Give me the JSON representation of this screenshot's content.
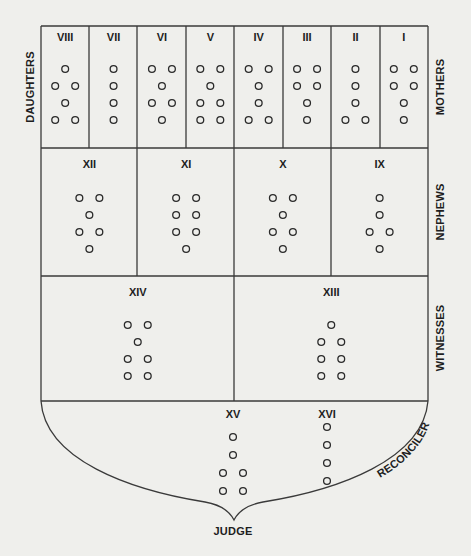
{
  "diagram": {
    "side_labels": {
      "daughters": "DAUGHTERS",
      "mothers": "MOTHERS",
      "nephews": "NEPHEWS",
      "witnesses": "WITNESSES",
      "reconciler": "RECONCILER",
      "judge": "JUDGE"
    },
    "rows": [
      {
        "name": "mothers-daughters",
        "figures": [
          {
            "numeral": "VIII",
            "lines": [
              1,
              2,
              1,
              2
            ]
          },
          {
            "numeral": "VII",
            "lines": [
              1,
              1,
              1,
              1
            ]
          },
          {
            "numeral": "VI",
            "lines": [
              2,
              1,
              2,
              1
            ]
          },
          {
            "numeral": "V",
            "lines": [
              2,
              1,
              2,
              2
            ]
          },
          {
            "numeral": "IV",
            "lines": [
              2,
              1,
              1,
              2
            ]
          },
          {
            "numeral": "III",
            "lines": [
              2,
              2,
              1,
              1
            ]
          },
          {
            "numeral": "II",
            "lines": [
              1,
              1,
              1,
              2
            ]
          },
          {
            "numeral": "I",
            "lines": [
              2,
              2,
              1,
              1
            ]
          }
        ]
      },
      {
        "name": "nephews",
        "figures": [
          {
            "numeral": "XII",
            "lines": [
              2,
              1,
              2,
              1
            ]
          },
          {
            "numeral": "XI",
            "lines": [
              2,
              2,
              2,
              1
            ]
          },
          {
            "numeral": "X",
            "lines": [
              2,
              1,
              2,
              1
            ]
          },
          {
            "numeral": "IX",
            "lines": [
              1,
              1,
              2,
              1
            ]
          }
        ]
      },
      {
        "name": "witnesses",
        "figures": [
          {
            "numeral": "XIV",
            "lines": [
              2,
              1,
              2,
              2
            ]
          },
          {
            "numeral": "XIII",
            "lines": [
              1,
              2,
              2,
              2
            ]
          }
        ]
      },
      {
        "name": "judge-reconciler",
        "figures": [
          {
            "numeral": "XV",
            "lines": [
              1,
              1,
              2,
              2
            ]
          },
          {
            "numeral": "XVI",
            "lines": [
              1,
              1,
              1,
              1
            ]
          }
        ]
      }
    ]
  }
}
